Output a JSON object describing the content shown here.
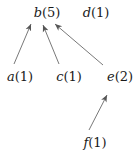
{
  "diagram": {
    "nodes": [
      {
        "id": "b",
        "letter": "b",
        "count": "(5)",
        "x": 47,
        "y": 12
      },
      {
        "id": "d",
        "letter": "d",
        "count": "(1)",
        "x": 96,
        "y": 12
      },
      {
        "id": "a",
        "letter": "a",
        "count": "(1)",
        "x": 20,
        "y": 76
      },
      {
        "id": "c",
        "letter": "c",
        "count": "(1)",
        "x": 69,
        "y": 76
      },
      {
        "id": "e",
        "letter": "e",
        "count": "(2)",
        "x": 120,
        "y": 76
      },
      {
        "id": "f",
        "letter": "f",
        "count": "(1)",
        "x": 95,
        "y": 142
      }
    ],
    "edges": [
      {
        "from": "a",
        "to": "b"
      },
      {
        "from": "c",
        "to": "b"
      },
      {
        "from": "e",
        "to": "b"
      },
      {
        "from": "f",
        "to": "e"
      }
    ],
    "colors": {
      "line": "#555555",
      "text": "#1a1a1a"
    }
  }
}
